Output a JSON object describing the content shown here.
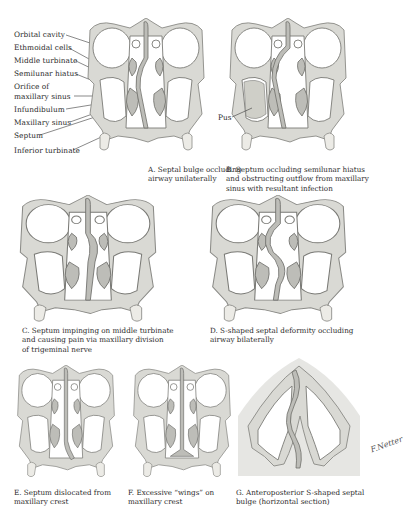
{
  "figure": {
    "panels": [
      {
        "id": "A",
        "caption": [
          "A. Septal bulge occluding",
          "airway unilaterally"
        ]
      },
      {
        "id": "B",
        "caption": [
          "B. Septum occluding semilunar hiatus",
          "and obstructing outflow from maxillary",
          "sinus with resultant infection"
        ],
        "inline_label": "Pus"
      },
      {
        "id": "C",
        "caption": [
          "C. Septum impinging on middle turbinate",
          "and causing pain via maxillary division",
          "of trigeminal nerve"
        ]
      },
      {
        "id": "D",
        "caption": [
          "D. S-shaped septal deformity occluding",
          "airway bilaterally"
        ]
      },
      {
        "id": "E",
        "caption": [
          "E. Septum dislocated from",
          "maxillary crest"
        ]
      },
      {
        "id": "F",
        "caption": [
          "F. Excessive “wings” on",
          "maxillary crest"
        ]
      },
      {
        "id": "G",
        "caption": [
          "G. Anteroposterior S-shaped septal",
          "bulge (horizontal section)"
        ]
      }
    ],
    "anatomy_labels": [
      "Orbital cavity",
      "Ethmoidal cells",
      "Middle turbinate",
      "Semilunar hiatus",
      "Orifice of",
      "maxillary sinus",
      "Infundibulum",
      "Maxillary sinus",
      "Septum",
      "Inferior turbinate"
    ],
    "signature": "F.Netter"
  }
}
